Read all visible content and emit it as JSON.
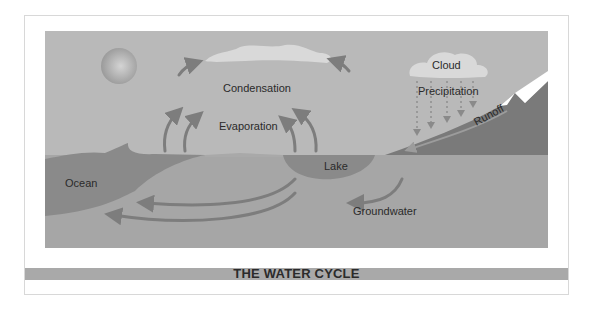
{
  "diagram": {
    "title": "THE WATER CYCLE",
    "labels": {
      "condensation": "Condensation",
      "evaporation": "Evaporation",
      "cloud": "Cloud",
      "precipitation": "Precipitation",
      "runoff": "Runoff",
      "ocean": "Ocean",
      "lake": "Lake",
      "groundwater": "Groundwater"
    },
    "icons": [
      "sun-icon",
      "cloud-icon",
      "rain-cloud-icon",
      "mountain-icon"
    ],
    "colors": {
      "sky": "#b9b9b9",
      "water": "#8a8a8a",
      "ground": "#a5a5a5",
      "mountain": "#7a7a7a",
      "arrow": "#7d7d7d",
      "cloud": "#d9d9d9",
      "title_band": "#a9a9a9",
      "frame_border": "#d8d8d8"
    }
  }
}
